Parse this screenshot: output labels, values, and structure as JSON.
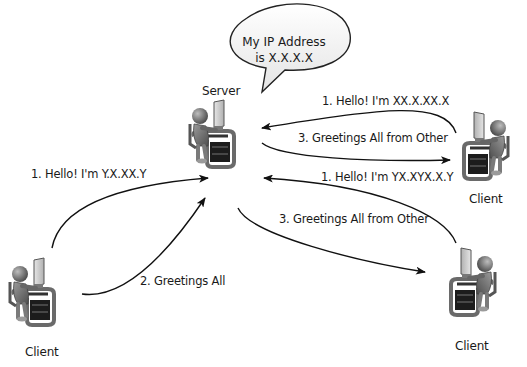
{
  "diagram": {
    "speech_bubble": {
      "line1": "My IP Address",
      "line2": "is X.X.X.X"
    },
    "nodes": {
      "server": {
        "label": "Server",
        "icon": "person-at-computer-icon"
      },
      "client_left": {
        "label": "Client",
        "icon": "person-at-computer-icon"
      },
      "client_top_right": {
        "label": "Client",
        "icon": "person-at-computer-icon"
      },
      "client_bottom_right": {
        "label": "Client",
        "icon": "person-at-computer-icon"
      }
    },
    "messages": {
      "left_hello": "1. Hello!  I'm Y.X.XX.Y",
      "left_greetings": "2. Greetings All",
      "tr_hello": "1. Hello!  I'm XX.X.XX.X",
      "tr_greetings": "3. Greetings All from Other",
      "br_hello": "1. Hello!  I'm YX.XYX.X.Y",
      "br_greetings": "3. Greetings All from Other"
    }
  }
}
